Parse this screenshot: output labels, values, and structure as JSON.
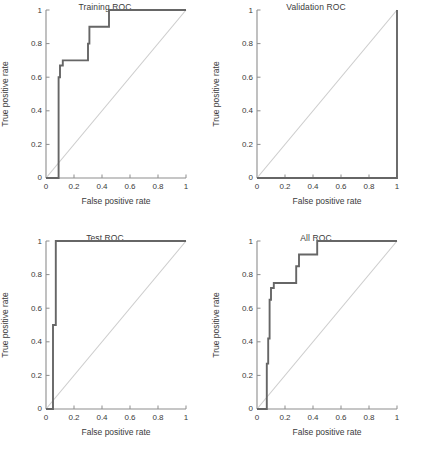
{
  "figure": {
    "panel_layout": "2x2",
    "axis_color": "#8d8d8d",
    "curve_color": "#666666",
    "diagonal_color": "#cccccc",
    "background": "#ffffff",
    "text_color": "#3b3b3b"
  },
  "axes": {
    "xlabel": "False positive rate",
    "ylabel": "True positive rate",
    "xticks": [
      "0",
      "0.2",
      "0.4",
      "0.6",
      "0.8",
      "1"
    ],
    "yticks": [
      "0",
      "0.2",
      "0.4",
      "0.6",
      "0.8",
      "1"
    ],
    "xlim": [
      0,
      1
    ],
    "ylim": [
      0,
      1
    ]
  },
  "chart_data": [
    {
      "type": "line",
      "title": "Training ROC",
      "xlabel": "False positive rate",
      "ylabel": "True positive rate",
      "xlim": [
        0,
        1
      ],
      "ylim": [
        0,
        1
      ],
      "grid": false,
      "legend": "none",
      "series": [
        {
          "name": "ROC curve",
          "color": "#666666",
          "x": [
            0,
            0.09,
            0.09,
            0.09,
            0.09,
            0.1,
            0.1,
            0.12,
            0.12,
            0.3,
            0.3,
            0.31,
            0.31,
            0.45,
            0.45,
            1
          ],
          "y": [
            0,
            0,
            0.3,
            0.4,
            0.6,
            0.6,
            0.67,
            0.67,
            0.7,
            0.7,
            0.8,
            0.8,
            0.9,
            0.9,
            1.0,
            1.0
          ]
        },
        {
          "name": "chance diagonal",
          "color": "#cccccc",
          "x": [
            0,
            1
          ],
          "y": [
            0,
            1
          ]
        }
      ]
    },
    {
      "type": "line",
      "title": "Validation ROC",
      "xlabel": "False positive rate",
      "ylabel": "True positive rate",
      "xlim": [
        0,
        1
      ],
      "ylim": [
        0,
        1
      ],
      "grid": false,
      "legend": "none",
      "series": [
        {
          "name": "ROC curve",
          "color": "#666666",
          "x": [
            0,
            1,
            1
          ],
          "y": [
            0,
            0,
            1
          ]
        },
        {
          "name": "chance diagonal",
          "color": "#cccccc",
          "x": [
            0,
            1
          ],
          "y": [
            0,
            1
          ]
        }
      ]
    },
    {
      "type": "line",
      "title": "Test ROC",
      "xlabel": "False positive rate",
      "ylabel": "True positive rate",
      "xlim": [
        0,
        1
      ],
      "ylim": [
        0,
        1
      ],
      "grid": false,
      "legend": "none",
      "series": [
        {
          "name": "ROC curve",
          "color": "#666666",
          "x": [
            0,
            0.05,
            0.05,
            0.07,
            0.07,
            1
          ],
          "y": [
            0,
            0,
            0.5,
            0.5,
            1.0,
            1.0
          ]
        },
        {
          "name": "chance diagonal",
          "color": "#cccccc",
          "x": [
            0,
            1
          ],
          "y": [
            0,
            1
          ]
        }
      ]
    },
    {
      "type": "line",
      "title": "All ROC",
      "xlabel": "False positive rate",
      "ylabel": "True positive rate",
      "xlim": [
        0,
        1
      ],
      "ylim": [
        0,
        1
      ],
      "grid": false,
      "legend": "none",
      "series": [
        {
          "name": "ROC curve",
          "color": "#666666",
          "x": [
            0,
            0.07,
            0.07,
            0.07,
            0.08,
            0.08,
            0.09,
            0.09,
            0.1,
            0.1,
            0.12,
            0.12,
            0.28,
            0.28,
            0.3,
            0.3,
            0.43,
            0.43,
            1
          ],
          "y": [
            0,
            0,
            0.2,
            0.27,
            0.27,
            0.42,
            0.42,
            0.65,
            0.65,
            0.72,
            0.72,
            0.75,
            0.75,
            0.85,
            0.85,
            0.92,
            0.92,
            1.0,
            1.0
          ]
        },
        {
          "name": "chance diagonal",
          "color": "#cccccc",
          "x": [
            0,
            1
          ],
          "y": [
            0,
            1
          ]
        }
      ]
    }
  ]
}
